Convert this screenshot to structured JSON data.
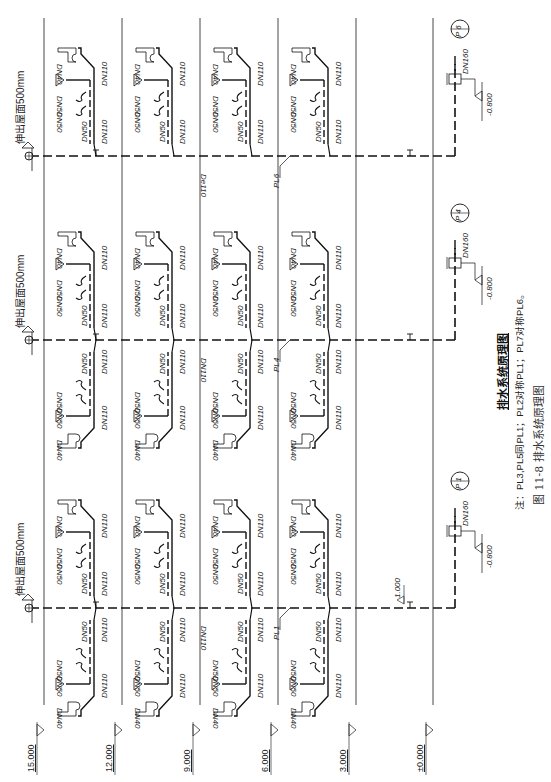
{
  "title": "排水系统原理图",
  "note": "注：PL3,PL5同PL1；PL2对称PL1；PL7对称PL6。",
  "caption": "图 11-8  排水系统原理图",
  "floor_levels": [
    "15.000",
    "12.000",
    "9.000",
    "6.000",
    "3.000",
    "±0.000"
  ],
  "stacks": [
    {
      "id": "PL6",
      "circle_label": "P 6",
      "main_pipe": "De110",
      "outlet_pipe": "DN160",
      "outlet_elev": "-0.800",
      "vent_label": "伸出屋面500mm"
    },
    {
      "id": "PL4",
      "circle_label": "P 4",
      "main_pipe": "DN110",
      "outlet_pipe": "DN160",
      "outlet_elev": "-0.800",
      "vent_label": "伸出屋面500mm"
    },
    {
      "id": "PL1",
      "circle_label": "P 1",
      "main_pipe": "DN110",
      "outlet_pipe": "DN160",
      "outlet_elev": "-0.800",
      "vent_label": "伸出屋面500mm",
      "extra_elev": "1.000"
    }
  ],
  "fixture_labels": {
    "toilet_branch": "DN40",
    "sink_branch": "DN50",
    "floor_drain": "DN50",
    "riser": "DN50",
    "branch_main": "DN110"
  }
}
